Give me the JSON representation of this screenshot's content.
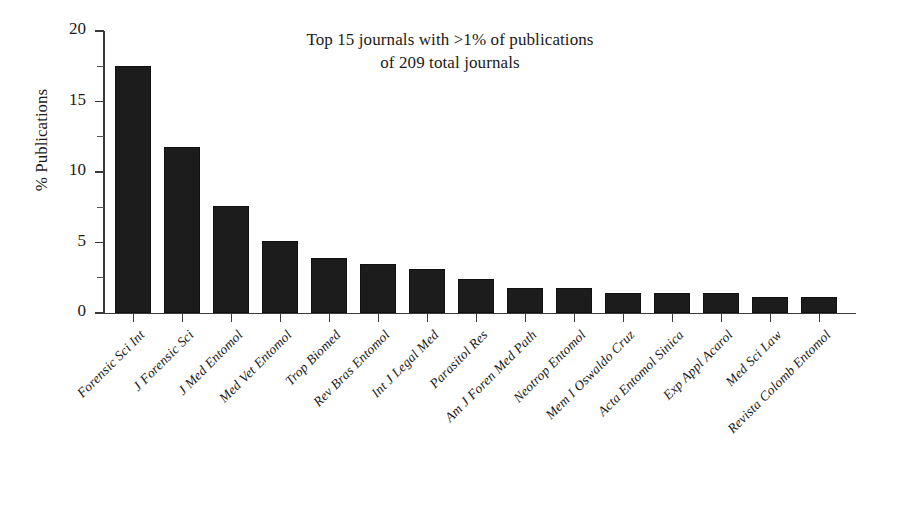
{
  "chart_data": {
    "type": "bar",
    "title": "Top 15 journals with >1% of publications of 209 total journals",
    "title_lines": [
      "Top 15 journals with >1% of publications",
      "of 209 total journals"
    ],
    "xlabel": "",
    "ylabel": "% Publications",
    "ylim": [
      0,
      20
    ],
    "yticks": [
      0,
      5,
      10,
      15,
      20
    ],
    "ytick_labels": [
      "0",
      "5",
      "10",
      "15",
      "20"
    ],
    "yminor_ticks": [
      2.5,
      7.5,
      12.5,
      17.5
    ],
    "grid": false,
    "legend": "none",
    "bar_color": "#1c1c1c",
    "categories": [
      "Forensic Sci Int",
      "J Forensic Sci",
      "J Med Entomol",
      "Med Vet Entomol",
      "Trop Biomed",
      "Rev Bras Entomol",
      "Int J Legal Med",
      "Parasitol Res",
      "Am J Foren Med Path",
      "Neotrop Entomol",
      "Mem I Oswaldo Cruz",
      "Acta Entomol Sinica",
      "Exp Appl Acarol",
      "Med Sci Law",
      "Revista Colomb Entomol"
    ],
    "values": [
      17.5,
      11.8,
      7.6,
      5.1,
      3.9,
      3.5,
      3.1,
      2.4,
      1.75,
      1.75,
      1.45,
      1.45,
      1.45,
      1.15,
      1.15
    ]
  }
}
